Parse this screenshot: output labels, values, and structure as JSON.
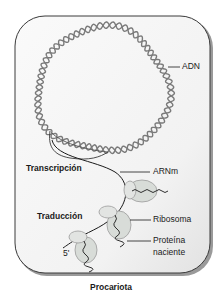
{
  "figure": {
    "caption": "Procariota",
    "cell_fill": "#f4f4f4",
    "cell_stroke": "#3a3a3a",
    "ribosome_fill": "#d8dcd8",
    "dna_stroke": "#7a7a7a"
  },
  "labels": {
    "dna": "ADN",
    "transcription": "Transcripción",
    "mrna": "ARNm",
    "translation": "Traducción",
    "ribosome": "Ribosoma",
    "protein_line1": "Proteína",
    "protein_line2": "naciente",
    "five_prime": "5'"
  }
}
